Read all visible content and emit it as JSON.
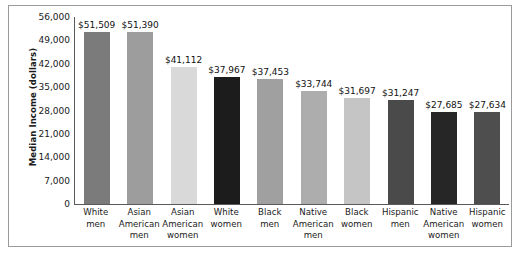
{
  "chart_data": {
    "type": "bar",
    "title": "",
    "xlabel": "",
    "ylabel": "Median Income (dollars)",
    "ylim": [
      0,
      56000
    ],
    "ytick_labels": [
      "56,000",
      "49,000",
      "42,000",
      "35,000",
      "28,000",
      "21,000",
      "14,000",
      "7,000",
      "0"
    ],
    "ytick_values": [
      56000,
      49000,
      42000,
      35000,
      28000,
      21000,
      14000,
      7000,
      0
    ],
    "grid": false,
    "legend": "none",
    "categories": [
      "White men",
      "Asian American men",
      "Asian American women",
      "White women",
      "Black men",
      "Native American men",
      "Black women",
      "Hispanic men",
      "Native American women",
      "Hispanic women"
    ],
    "category_lines": [
      [
        "White",
        "men"
      ],
      [
        "Asian",
        "American",
        "men"
      ],
      [
        "Asian",
        "American",
        "women"
      ],
      [
        "White",
        "women"
      ],
      [
        "Black",
        "men"
      ],
      [
        "Native",
        "American",
        "men"
      ],
      [
        "Black",
        "women"
      ],
      [
        "Hispanic",
        "men"
      ],
      [
        "Native",
        "American",
        "women"
      ],
      [
        "Hispanic",
        "women"
      ]
    ],
    "values": [
      51509,
      51390,
      41112,
      37967,
      37453,
      33744,
      31697,
      31247,
      27685,
      27634
    ],
    "value_labels": [
      "$51,509",
      "$51,390",
      "$41,112",
      "$37,967",
      "$37,453",
      "$33,744",
      "$31,697",
      "$31,247",
      "$27,685",
      "$27,634"
    ],
    "bar_colors": [
      "#7b7b7b",
      "#9d9d9d",
      "#d9d9d9",
      "#1c1c1c",
      "#a0a0a0",
      "#adadad",
      "#c5c5c5",
      "#4a4a4a",
      "#262626",
      "#4e4e4e"
    ]
  }
}
